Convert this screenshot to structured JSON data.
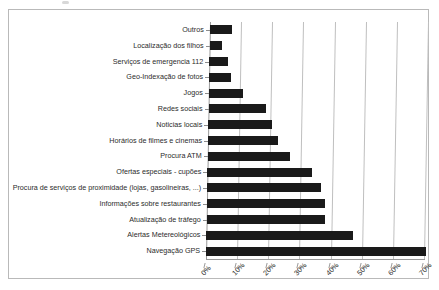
{
  "chart_data": {
    "type": "bar",
    "orientation": "horizontal",
    "title": "",
    "subtitle": "",
    "xlabel": "",
    "ylabel": "",
    "xlim": [
      0,
      70
    ],
    "xtick_labels": [
      "0%",
      "10%",
      "20%",
      "30%",
      "40%",
      "50%",
      "60%",
      "70%"
    ],
    "xtick_values": [
      0,
      10,
      20,
      30,
      40,
      50,
      60,
      70
    ],
    "grid": true,
    "legend": "none",
    "value_unit": "%",
    "categories": [
      "Outros",
      "Localização dos filhos",
      "Serviços de emergencia 112",
      "Geo-Indexação de fotos",
      "Jogos",
      "Redes sociais",
      "Noticias locais",
      "Horários de filmes e cinemas",
      "Procura ATM",
      "Ofertas especiais - cupões",
      "Procura de serviços de proximidade (lojas, gasolineiras, ...)",
      "Informações sobre restaurantes",
      "Atualização de tráfego",
      "Alertas Metereológicos",
      "Navegação GPS"
    ],
    "values": [
      7,
      4,
      6,
      7,
      11,
      18.5,
      20.5,
      22.5,
      26.5,
      33.5,
      36.5,
      38,
      38,
      47,
      70.5
    ],
    "series": [
      {
        "name": "Percentagem de utilizadores",
        "values": [
          7,
          4,
          6,
          7,
          11,
          18.5,
          20.5,
          22.5,
          26.5,
          33.5,
          36.5,
          38,
          38,
          47,
          70.5
        ]
      }
    ],
    "colors": {
      "bar": "#1a1a1a",
      "gridline": "#bfbfbf",
      "axis": "#9a9a9a",
      "background": "#ffffff",
      "text": "#2b2b2b",
      "frame": "#b9b9b9"
    }
  }
}
